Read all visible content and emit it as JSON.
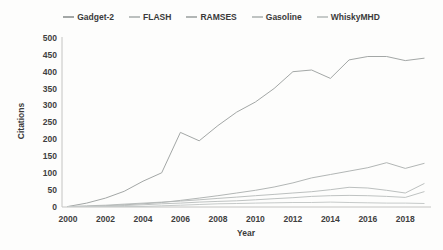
{
  "chart_data": {
    "type": "line",
    "title": "",
    "xlabel": "Year",
    "ylabel": "Citations",
    "x": [
      2000,
      2001,
      2002,
      2003,
      2004,
      2005,
      2006,
      2007,
      2008,
      2009,
      2010,
      2011,
      2012,
      2013,
      2014,
      2015,
      2016,
      2017,
      2018,
      2019
    ],
    "xticks": [
      2000,
      2002,
      2004,
      2006,
      2008,
      2010,
      2012,
      2014,
      2016,
      2018
    ],
    "yticks": [
      0,
      50,
      100,
      150,
      200,
      250,
      300,
      350,
      400,
      450,
      500
    ],
    "ylim": [
      0,
      500
    ],
    "grid": false,
    "legend_position": "top-center",
    "background_color": "#fdfdfc",
    "axis_color": "#c4c4c2",
    "text_color": "#3a3a3a",
    "series": [
      {
        "name": "Gadget-2",
        "color": "#a3a7a6",
        "values": [
          0,
          10,
          25,
          45,
          75,
          100,
          220,
          195,
          240,
          280,
          310,
          350,
          400,
          405,
          380,
          435,
          445,
          445,
          433,
          440
        ]
      },
      {
        "name": "FLASH",
        "color": "#bcc0bf",
        "values": [
          0,
          2,
          4,
          7,
          10,
          13,
          16,
          20,
          24,
          28,
          32,
          36,
          40,
          44,
          50,
          57,
          55,
          48,
          40,
          68
        ]
      },
      {
        "name": "RAMSES",
        "color": "#b2b6b5",
        "values": [
          0,
          0,
          2,
          5,
          8,
          12,
          18,
          25,
          32,
          40,
          48,
          58,
          70,
          85,
          95,
          105,
          115,
          130,
          113,
          128
        ]
      },
      {
        "name": "Gasoline",
        "color": "#bfc3c2",
        "values": [
          0,
          0,
          1,
          3,
          5,
          8,
          10,
          13,
          15,
          17,
          20,
          23,
          26,
          30,
          32,
          33,
          32,
          30,
          27,
          44
        ]
      },
      {
        "name": "WhiskyMHD",
        "color": "#c6cac9",
        "values": [
          0,
          0,
          0,
          0,
          0,
          2,
          4,
          6,
          8,
          9,
          10,
          11,
          12,
          12,
          13,
          12,
          11,
          10,
          10,
          9
        ]
      }
    ]
  }
}
